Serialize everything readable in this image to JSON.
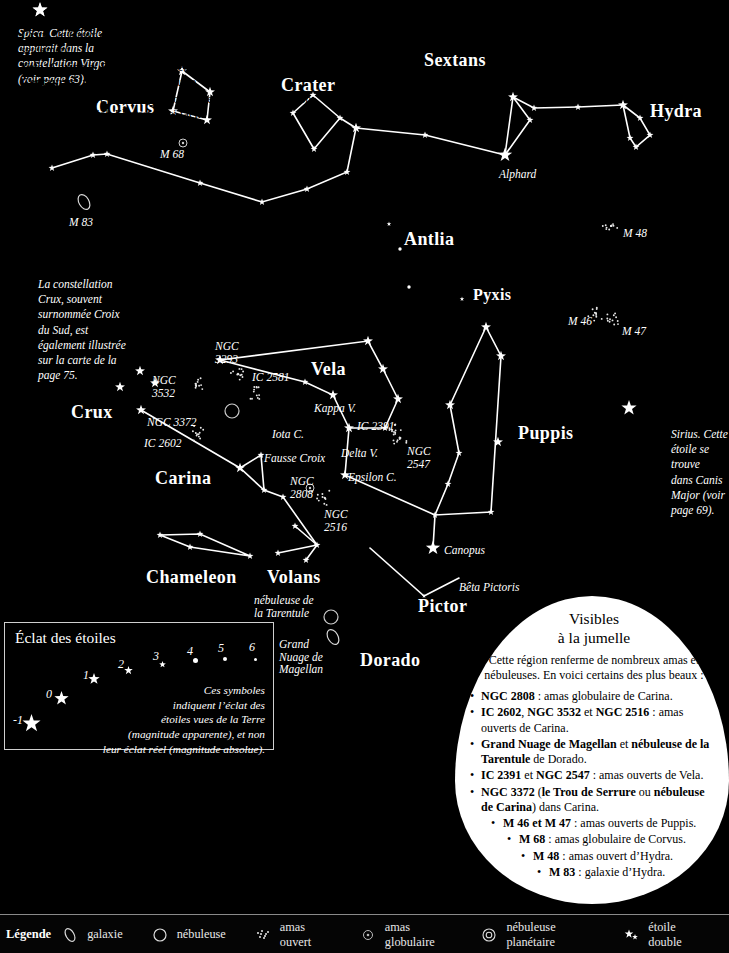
{
  "map": {
    "title": "Carte du ciel austral",
    "constellations": [
      {
        "name": "Corvus",
        "x": 96,
        "y": 97,
        "size": "lg"
      },
      {
        "name": "Crater",
        "x": 281,
        "y": 75,
        "size": "lg"
      },
      {
        "name": "Sextans",
        "x": 424,
        "y": 50,
        "size": "lg"
      },
      {
        "name": "Hydra",
        "x": 650,
        "y": 101,
        "size": "lg"
      },
      {
        "name": "Antlia",
        "x": 404,
        "y": 229,
        "size": "lg"
      },
      {
        "name": "Pyxis",
        "x": 473,
        "y": 286,
        "size": "sm"
      },
      {
        "name": "Vela",
        "x": 311,
        "y": 359,
        "size": "lg"
      },
      {
        "name": "Crux",
        "x": 71,
        "y": 402,
        "size": "lg"
      },
      {
        "name": "Carina",
        "x": 155,
        "y": 468,
        "size": "lg"
      },
      {
        "name": "Puppis",
        "x": 518,
        "y": 423,
        "size": "lg"
      },
      {
        "name": "Chameleon",
        "x": 146,
        "y": 567,
        "size": "lg"
      },
      {
        "name": "Volans",
        "x": 267,
        "y": 567,
        "size": "lg"
      },
      {
        "name": "Pictor",
        "x": 418,
        "y": 596,
        "size": "lg"
      },
      {
        "name": "Dorado",
        "x": 360,
        "y": 650,
        "size": "lg"
      }
    ],
    "star_labels": [
      {
        "name": "Alphard",
        "x": 499,
        "y": 168
      },
      {
        "name": "Kappa V.",
        "x": 314,
        "y": 402
      },
      {
        "name": "Iota C.",
        "x": 272,
        "y": 428
      },
      {
        "name": "Delta V.",
        "x": 341,
        "y": 447
      },
      {
        "name": "Epsilon C.",
        "x": 348,
        "y": 471
      },
      {
        "name": "Fausse Croix",
        "x": 264,
        "y": 452
      },
      {
        "name": "Canopus",
        "x": 444,
        "y": 544
      },
      {
        "name": "Bêta Pictoris",
        "x": 459,
        "y": 581
      }
    ],
    "object_labels": [
      {
        "name": "M 68",
        "x": 160,
        "y": 148
      },
      {
        "name": "M 83",
        "x": 69,
        "y": 216
      },
      {
        "name": "M 48",
        "x": 623,
        "y": 227
      },
      {
        "name": "M 46",
        "x": 568,
        "y": 315
      },
      {
        "name": "M 47",
        "x": 622,
        "y": 325
      },
      {
        "name": "NGC\n3293",
        "x": 215,
        "y": 340
      },
      {
        "name": "IC 2581",
        "x": 252,
        "y": 371
      },
      {
        "name": "NGC\n3532",
        "x": 152,
        "y": 374
      },
      {
        "name": "NGC 3372",
        "x": 147,
        "y": 416
      },
      {
        "name": "IC 2602",
        "x": 144,
        "y": 437
      },
      {
        "name": "IC 2391",
        "x": 357,
        "y": 420
      },
      {
        "name": "NGC\n2547",
        "x": 407,
        "y": 445
      },
      {
        "name": "NGC\n2808",
        "x": 290,
        "y": 475
      },
      {
        "name": "NGC\n2516",
        "x": 324,
        "y": 508
      },
      {
        "name": "nébuleuse de\nla Tarentule",
        "x": 254,
        "y": 594
      },
      {
        "name": "Grand\nNuage de\nMagellan",
        "x": 279,
        "y": 638
      }
    ],
    "annotations": [
      {
        "id": "spica",
        "x": 18,
        "y": 26,
        "star_x": 40,
        "star_y": 10,
        "text": "Spica. Cette étoile\napparait dans la\nconstellation Virgo\n(voir page 63)."
      },
      {
        "id": "crux",
        "x": 38,
        "y": 277,
        "star_x": null,
        "star_y": null,
        "text": "La constellation\nCrux, souvent\nsurnommée Croix\ndu Sud, est\négalement illustrée\nsur la carte de la\npage 75."
      },
      {
        "id": "sirius",
        "x": 671,
        "y": 427,
        "star_x": 629,
        "star_y": 408,
        "text": "Sirius. Cette\nétoile se trouve\ndans Canis\nMajor (voir\npage 69)."
      }
    ]
  },
  "magnitude_panel": {
    "title": "Éclat des étoiles",
    "note": "Ces symboles\nindiquent l’éclat des\nétoiles vues de la Terre\n(magnitude apparente), et non\nleur éclat réel (magnitude absolue).",
    "scale": [
      {
        "label": "-1",
        "x": 12,
        "y": 712,
        "star_x": 30,
        "star_y": 722,
        "size": 19
      },
      {
        "label": "0",
        "x": 45,
        "y": 686,
        "star_x": 60,
        "star_y": 697,
        "size": 15
      },
      {
        "label": "1",
        "x": 82,
        "y": 667,
        "star_x": 93,
        "star_y": 677,
        "size": 12
      },
      {
        "label": "2",
        "x": 117,
        "y": 656,
        "star_x": 127,
        "star_y": 665,
        "size": 9
      },
      {
        "label": "3",
        "x": 152,
        "y": 648,
        "star_x": 161,
        "star_y": 657,
        "size": 7
      },
      {
        "label": "4",
        "x": 186,
        "y": 643,
        "star_x": 194,
        "star_y": 651,
        "size": 5
      },
      {
        "label": "5",
        "x": 217,
        "y": 640,
        "star_x": 224,
        "star_y": 649,
        "size": 4
      },
      {
        "label": "6",
        "x": 248,
        "y": 639,
        "star_x": 254,
        "star_y": 648,
        "size": 3
      }
    ]
  },
  "constellations_panel": {
    "title": "Constellations les plus faciles à repérer",
    "items": [
      [
        {
          "t": "Crux",
          "b": true
        },
        {
          "t": " : la Croix du Sud, visible dans l’hémisphère Sud seulement.",
          "b": false
        }
      ],
      [
        {
          "t": "Vela",
          "b": true
        },
        {
          "t": ", ",
          "b": false
        },
        {
          "t": "Carina",
          "b": true
        },
        {
          "t": " et ",
          "b": false
        },
        {
          "t": "Puppis",
          "b": true
        },
        {
          "t": " se trouvent d’un côté de Crux, et ",
          "b": false
        },
        {
          "t": "Centaurus",
          "b": true
        },
        {
          "t": " (voir page 75) de l’autre.",
          "b": false
        }
      ],
      [
        {
          "t": "Corvus",
          "b": true
        },
        {
          "t": " se trouve sous Virgo (voir page 63) dans une région plutôt vide du ciel. Elle est ainsi facile à repérer.",
          "b": false
        }
      ]
    ]
  },
  "binocular_panel": {
    "title": "Visibles\nà la jumelle",
    "intro": "Cette région renferme de nombreux amas et nébuleuses. En voici certains des plus beaux :",
    "items": [
      {
        "indent": 0,
        "center": false,
        "parts": [
          {
            "t": "NGC 2808",
            "b": true
          },
          {
            "t": " : amas globulaire de Carina.",
            "b": false
          }
        ]
      },
      {
        "indent": 0,
        "center": false,
        "parts": [
          {
            "t": "IC 2602",
            "b": true
          },
          {
            "t": ", ",
            "b": false
          },
          {
            "t": "NGC 3532",
            "b": true
          },
          {
            "t": " et ",
            "b": false
          },
          {
            "t": "NGC 2516",
            "b": true
          },
          {
            "t": " : amas ouverts de Carina.",
            "b": false
          }
        ]
      },
      {
        "indent": 0,
        "center": false,
        "parts": [
          {
            "t": "Grand Nuage de Magellan",
            "b": true
          },
          {
            "t": " et ",
            "b": false
          },
          {
            "t": "nébuleuse de la Tarentule",
            "b": true
          },
          {
            "t": " de Dorado.",
            "b": false
          }
        ]
      },
      {
        "indent": 0,
        "center": false,
        "parts": [
          {
            "t": "IC 2391",
            "b": true
          },
          {
            "t": " et ",
            "b": false
          },
          {
            "t": "NGC 2547",
            "b": true
          },
          {
            "t": " : amas ouverts de Vela.",
            "b": false
          }
        ]
      },
      {
        "indent": 0,
        "center": false,
        "parts": [
          {
            "t": "NGC 3372",
            "b": true
          },
          {
            "t": " (",
            "b": false
          },
          {
            "t": "le Trou de Serrure",
            "b": true
          },
          {
            "t": " ou ",
            "b": false
          },
          {
            "t": "nébuleuse de Carina",
            "b": true
          },
          {
            "t": ") dans Carina.",
            "b": false
          }
        ]
      },
      {
        "indent": 1,
        "center": false,
        "parts": [
          {
            "t": "M 46 et M 47",
            "b": true
          },
          {
            "t": " : amas ouverts de Puppis.",
            "b": false
          }
        ]
      },
      {
        "indent": 2,
        "center": false,
        "parts": [
          {
            "t": "M 68",
            "b": true
          },
          {
            "t": " : amas globulaire de Corvus.",
            "b": false
          }
        ]
      },
      {
        "indent": 3,
        "center": false,
        "parts": [
          {
            "t": "M 48",
            "b": true
          },
          {
            "t": " : amas ouvert d’Hydra.",
            "b": false
          }
        ]
      },
      {
        "indent": 4,
        "center": false,
        "parts": [
          {
            "t": "M 83",
            "b": true
          },
          {
            "t": " : galaxie d’Hydra.",
            "b": false
          }
        ]
      }
    ]
  },
  "legend": {
    "title": "Légende",
    "items": [
      {
        "icon": "galaxy-icon",
        "label": "galaxie"
      },
      {
        "icon": "nebula-icon",
        "label": "nébuleuse"
      },
      {
        "icon": "open-cluster-icon",
        "label": "amas ouvert"
      },
      {
        "icon": "globular-cluster-icon",
        "label": "amas globulaire"
      },
      {
        "icon": "planetary-nebula-icon",
        "label": "nébuleuse planétaire"
      },
      {
        "icon": "double-star-icon",
        "label": "étoile double"
      }
    ]
  },
  "chart_data": {
    "type": "scatter",
    "xlabel": "",
    "ylabel": "",
    "stars": [
      {
        "x": 40,
        "y": 10,
        "mag": 1
      },
      {
        "x": 182,
        "y": 71,
        "mag": 2
      },
      {
        "x": 210,
        "y": 92,
        "mag": 2
      },
      {
        "x": 173,
        "y": 111,
        "mag": 2
      },
      {
        "x": 207,
        "y": 120,
        "mag": 2
      },
      {
        "x": 313,
        "y": 95,
        "mag": 3
      },
      {
        "x": 293,
        "y": 113,
        "mag": 3
      },
      {
        "x": 340,
        "y": 118,
        "mag": 3
      },
      {
        "x": 314,
        "y": 149,
        "mag": 3
      },
      {
        "x": 356,
        "y": 128,
        "mag": 2
      },
      {
        "x": 425,
        "y": 135,
        "mag": 3
      },
      {
        "x": 513,
        "y": 97,
        "mag": 2
      },
      {
        "x": 534,
        "y": 108,
        "mag": 3
      },
      {
        "x": 578,
        "y": 107,
        "mag": 3
      },
      {
        "x": 623,
        "y": 105,
        "mag": 2
      },
      {
        "x": 640,
        "y": 118,
        "mag": 3
      },
      {
        "x": 630,
        "y": 138,
        "mag": 3
      },
      {
        "x": 650,
        "y": 135,
        "mag": 3
      },
      {
        "x": 636,
        "y": 147,
        "mag": 3
      },
      {
        "x": 505,
        "y": 155,
        "mag": 1
      },
      {
        "x": 530,
        "y": 120,
        "mag": 3
      },
      {
        "x": 52,
        "y": 168,
        "mag": 3
      },
      {
        "x": 93,
        "y": 155,
        "mag": 3
      },
      {
        "x": 107,
        "y": 154,
        "mag": 3
      },
      {
        "x": 262,
        "y": 202,
        "mag": 3
      },
      {
        "x": 200,
        "y": 183,
        "mag": 3
      },
      {
        "x": 307,
        "y": 189,
        "mag": 3
      },
      {
        "x": 347,
        "y": 172,
        "mag": 3
      },
      {
        "x": 389,
        "y": 224,
        "mag": 4
      },
      {
        "x": 400,
        "y": 249,
        "mag": 5
      },
      {
        "x": 409,
        "y": 287,
        "mag": 5
      },
      {
        "x": 462,
        "y": 299,
        "mag": 4
      },
      {
        "x": 220,
        "y": 360,
        "mag": 2
      },
      {
        "x": 368,
        "y": 341,
        "mag": 2
      },
      {
        "x": 383,
        "y": 369,
        "mag": 2
      },
      {
        "x": 398,
        "y": 399,
        "mag": 2
      },
      {
        "x": 305,
        "y": 382,
        "mag": 3
      },
      {
        "x": 333,
        "y": 395,
        "mag": 2
      },
      {
        "x": 349,
        "y": 428,
        "mag": 2
      },
      {
        "x": 385,
        "y": 428,
        "mag": 3
      },
      {
        "x": 345,
        "y": 475,
        "mag": 2
      },
      {
        "x": 240,
        "y": 468,
        "mag": 2
      },
      {
        "x": 261,
        "y": 455,
        "mag": 3
      },
      {
        "x": 264,
        "y": 490,
        "mag": 3
      },
      {
        "x": 283,
        "y": 497,
        "mag": 3
      },
      {
        "x": 120,
        "y": 387,
        "mag": 2
      },
      {
        "x": 155,
        "y": 383,
        "mag": 2
      },
      {
        "x": 140,
        "y": 371,
        "mag": 2
      },
      {
        "x": 141,
        "y": 410,
        "mag": 2
      },
      {
        "x": 486,
        "y": 327,
        "mag": 2
      },
      {
        "x": 501,
        "y": 356,
        "mag": 2
      },
      {
        "x": 450,
        "y": 405,
        "mag": 2
      },
      {
        "x": 498,
        "y": 442,
        "mag": 2
      },
      {
        "x": 459,
        "y": 453,
        "mag": 3
      },
      {
        "x": 448,
        "y": 484,
        "mag": 3
      },
      {
        "x": 435,
        "y": 515,
        "mag": 3
      },
      {
        "x": 491,
        "y": 512,
        "mag": 3
      },
      {
        "x": 433,
        "y": 548,
        "mag": 1
      },
      {
        "x": 424,
        "y": 596,
        "mag": 4
      },
      {
        "x": 160,
        "y": 535,
        "mag": 3
      },
      {
        "x": 200,
        "y": 534,
        "mag": 3
      },
      {
        "x": 190,
        "y": 547,
        "mag": 3
      },
      {
        "x": 250,
        "y": 556,
        "mag": 3
      },
      {
        "x": 295,
        "y": 526,
        "mag": 3
      },
      {
        "x": 278,
        "y": 553,
        "mag": 3
      },
      {
        "x": 306,
        "y": 560,
        "mag": 3
      },
      {
        "x": 317,
        "y": 545,
        "mag": 3
      }
    ],
    "deep_sky": [
      {
        "name": "M 68",
        "type": "globular",
        "x": 183,
        "y": 143
      },
      {
        "name": "M 83",
        "type": "galaxy",
        "x": 84,
        "y": 202
      },
      {
        "name": "M 48",
        "type": "open",
        "x": 611,
        "y": 226
      },
      {
        "name": "M 46",
        "type": "open",
        "x": 596,
        "y": 313
      },
      {
        "name": "M 47",
        "type": "open",
        "x": 612,
        "y": 320
      },
      {
        "name": "NGC 3293",
        "type": "open",
        "x": 238,
        "y": 372
      },
      {
        "name": "IC 2581",
        "type": "open",
        "x": 255,
        "y": 392
      },
      {
        "name": "NGC 3532",
        "type": "open",
        "x": 196,
        "y": 384
      },
      {
        "name": "NGC 3372",
        "type": "nebula",
        "x": 232,
        "y": 411
      },
      {
        "name": "IC 2602",
        "type": "open",
        "x": 196,
        "y": 434
      },
      {
        "name": "IC 2391",
        "type": "open",
        "x": 393,
        "y": 432
      },
      {
        "name": "NGC 2547",
        "type": "open",
        "x": 400,
        "y": 438
      },
      {
        "name": "NGC 2808",
        "type": "globular",
        "x": 310,
        "y": 488
      },
      {
        "name": "NGC 2516",
        "type": "open",
        "x": 325,
        "y": 498
      },
      {
        "name": "nebuleuse de la Tarentule",
        "type": "nebula",
        "x": 331,
        "y": 617
      },
      {
        "name": "Grand Nuage de Magellan",
        "type": "galaxy",
        "x": 333,
        "y": 637
      }
    ]
  }
}
